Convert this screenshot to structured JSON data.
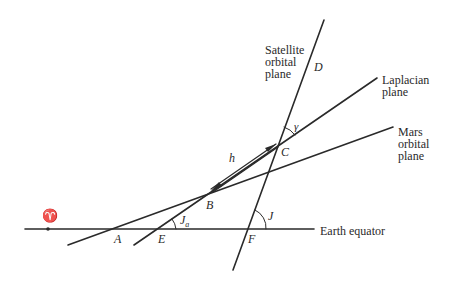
{
  "diagram": {
    "type": "orbital-planes-geometry",
    "colors": {
      "line": "#2a2a2a",
      "background": "#ffffff"
    },
    "plane_labels": {
      "satellite": [
        "Satellite",
        "orbital",
        "plane"
      ],
      "laplacian": [
        "Laplacian",
        "plane"
      ],
      "mars": [
        "Mars",
        "orbital",
        "plane"
      ],
      "equator": "Earth equator"
    },
    "points": {
      "A": "A",
      "B": "B",
      "C": "C",
      "D": "D",
      "E": "E",
      "F": "F"
    },
    "angles": {
      "gamma": "γ",
      "J": "J",
      "Ja_main": "J",
      "Ja_sub": "a"
    },
    "vernal_equinox": "♈",
    "distance_label": "h"
  }
}
